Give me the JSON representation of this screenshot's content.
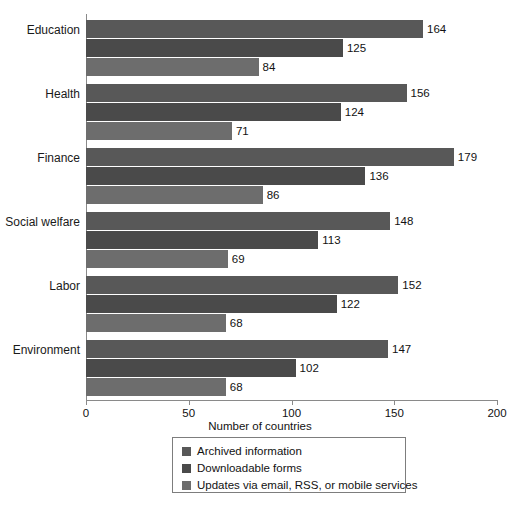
{
  "chart_data": {
    "type": "bar",
    "orientation": "horizontal",
    "title": "",
    "xlabel": "Number of countries",
    "ylabel": "",
    "xlim": [
      0,
      200
    ],
    "xticks": [
      0,
      50,
      100,
      150,
      200
    ],
    "grid": false,
    "legend_position": "bottom",
    "categories": [
      "Education",
      "Health",
      "Finance",
      "Social welfare",
      "Labor",
      "Environment"
    ],
    "series": [
      {
        "name": "Archived information",
        "color": "#585858",
        "values": [
          164,
          156,
          179,
          148,
          152,
          147
        ]
      },
      {
        "name": "Downloadable forms",
        "color": "#4a4a4a",
        "values": [
          125,
          124,
          136,
          113,
          122,
          102
        ]
      },
      {
        "name": "Updates via email, RSS, or mobile services",
        "color": "#6d6d6d",
        "values": [
          84,
          71,
          86,
          69,
          68,
          68
        ]
      }
    ]
  },
  "axis": {
    "x_title": "Number of countries",
    "tick_labels": [
      "0",
      "50",
      "100",
      "150",
      "200"
    ]
  },
  "legend": {
    "items": [
      {
        "label": "Archived information",
        "color": "#585858"
      },
      {
        "label": "Downloadable forms",
        "color": "#4a4a4a"
      },
      {
        "label": "Updates via email, RSS, or mobile services",
        "color": "#6d6d6d"
      }
    ]
  }
}
